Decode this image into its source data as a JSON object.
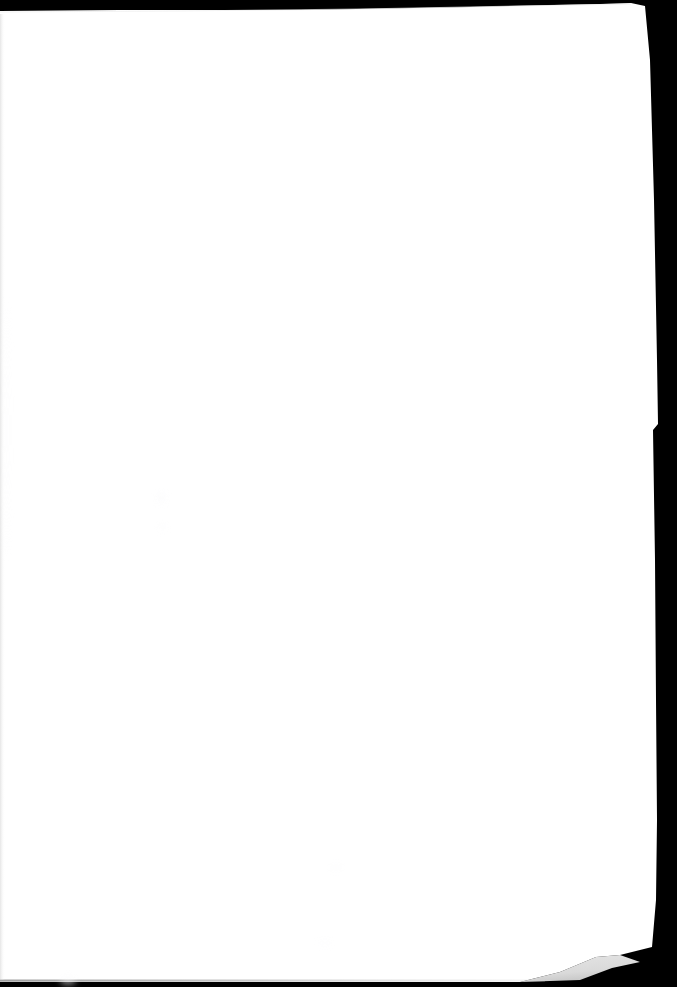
{
  "document": {
    "kind": "scanned-page",
    "page_label": "",
    "body_text": "",
    "is_blank": true,
    "orientation": "portrait"
  },
  "canvas": {
    "width": 677,
    "height": 987
  },
  "colors": {
    "backdrop": "#000000",
    "paper": "#ffffff",
    "paper_shadow": "#9a9a9a",
    "paper_edge_line": "#c8c8c8",
    "smudge": "#fbfbfc"
  },
  "geometry": {
    "paper_outline_points": "0,11 120,10 300,10 470,7 600,4 631,3 645,6 650,60 654,200 657,360 658,424 653,430 655,560 656,700 657,820 656,900 652,947 620,955 596,957 560,972 520,982 300,982 120,982 0,982",
    "top_edge_note": "sloped: y=11 at left, y=3 near x=631",
    "right_edge_note": "near-vertical x=648..658, small inward notch at y=424-430",
    "bottom_fold_apex": "620,955",
    "bottom_edge_y": 982
  },
  "marks": {
    "smudges": [
      {
        "x": 157,
        "y": 492,
        "w": 9,
        "h": 12,
        "opacity": 0.55
      },
      {
        "x": 159,
        "y": 524,
        "w": 7,
        "h": 7,
        "opacity": 0.45
      },
      {
        "x": 330,
        "y": 864,
        "w": 12,
        "h": 7,
        "opacity": 0.4
      },
      {
        "x": 318,
        "y": 940,
        "w": 14,
        "h": 6,
        "opacity": 0.35
      },
      {
        "x": 60,
        "y": 976,
        "w": 16,
        "h": 9,
        "opacity": 0.5
      },
      {
        "x": 4,
        "y": 300,
        "w": 5,
        "h": 260,
        "opacity": 0.3
      }
    ]
  }
}
